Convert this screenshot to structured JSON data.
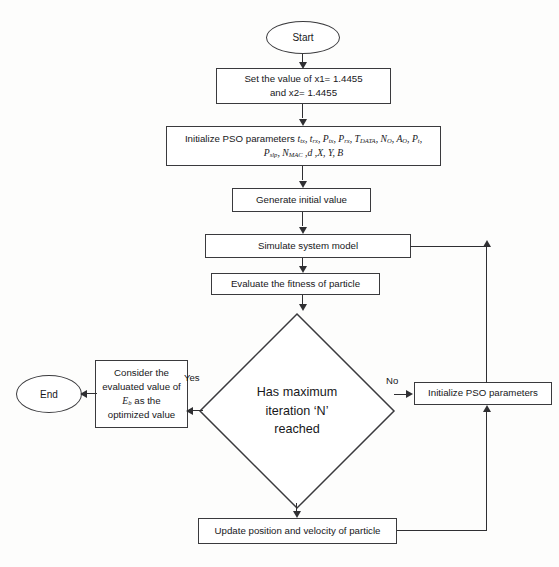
{
  "diagram": {
    "type": "flowchart",
    "stroke_color": "#2f2f32",
    "text_color": "#17171a",
    "background_color": "#fdfdfc"
  },
  "nodes": {
    "start": {
      "label": "Start",
      "shape": "terminal"
    },
    "set_values": {
      "line1": "Set the value of x1= 1.4455",
      "line2": "and x2=  1.4455",
      "shape": "process"
    },
    "init_params": {
      "prefix": "Initialize PSO parameters ",
      "line1_params": "t_tx, t_rx, P_tx, P_rx, T_DATA, N_O, A_O, P_t,",
      "line2_params": "P_slp, N_MAC, d, X, Y, B",
      "shape": "process"
    },
    "generate_initial": {
      "label": "Generate initial value",
      "shape": "process"
    },
    "simulate": {
      "label": "Simulate system model",
      "shape": "process"
    },
    "evaluate": {
      "label": "Evaluate the fitness of particle",
      "shape": "process"
    },
    "decision": {
      "line1": "Has maximum",
      "line2": "iteration ‘N’",
      "line3": "reached",
      "shape": "decision"
    },
    "consider": {
      "line1": "Consider the",
      "line2": "evaluated value of",
      "line3": "E_b as the",
      "line4": "optimized value",
      "shape": "process"
    },
    "end": {
      "label": "End",
      "shape": "terminal"
    },
    "reinit_params": {
      "label": "Initialize PSO parameters",
      "shape": "process"
    },
    "update": {
      "label": "Update position and velocity of particle",
      "shape": "process"
    }
  },
  "edge_labels": {
    "yes": "Yes",
    "no": "No"
  },
  "math_symbols": {
    "t_tx": {
      "base": "t",
      "sub": "tx"
    },
    "t_rx": {
      "base": "t",
      "sub": "rx"
    },
    "P_tx": {
      "base": "P",
      "sub": "tx"
    },
    "P_rx": {
      "base": "P",
      "sub": "rx"
    },
    "T_DATA": {
      "base": "T",
      "sub": "DATA"
    },
    "N_O": {
      "base": "N",
      "sub": "O"
    },
    "A_O": {
      "base": "A",
      "sub": "O"
    },
    "P_t": {
      "base": "P",
      "sub": "t"
    },
    "P_slp": {
      "base": "P",
      "sub": "slp"
    },
    "N_MAC": {
      "base": "N",
      "sub": "MAC"
    },
    "d": {
      "base": "d",
      "sub": ""
    },
    "X": {
      "base": "X",
      "sub": ""
    },
    "Y": {
      "base": "Y",
      "sub": ""
    },
    "B": {
      "base": "B",
      "sub": ""
    },
    "E_b": {
      "base": "E",
      "sub": "b"
    }
  },
  "artifacts": {
    "top_bleed": "",
    "mid_bleed_1": "",
    "mid_bleed_2": ""
  }
}
